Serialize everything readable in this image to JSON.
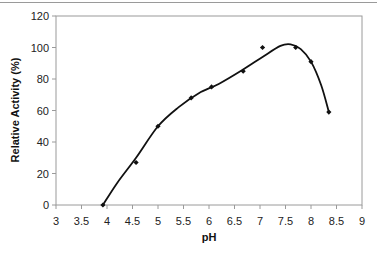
{
  "chart_data": {
    "type": "scatter",
    "title": "",
    "xlabel": "pH",
    "ylabel": "Relative Activity (%)",
    "xlim": [
      3,
      9
    ],
    "ylim": [
      0,
      120
    ],
    "x_ticks": [
      "3",
      "3.5",
      "4",
      "4.5",
      "5",
      "5.5",
      "6",
      "6.5",
      "7",
      "7.5",
      "8",
      "8.5",
      "9"
    ],
    "y_ticks": [
      "0",
      "20",
      "40",
      "60",
      "80",
      "100",
      "120"
    ],
    "grid": false,
    "legend": null,
    "series": [
      {
        "name": "Relative Activity",
        "marker": "diamond",
        "x": [
          3.92,
          4.57,
          5.0,
          5.65,
          6.05,
          6.67,
          7.05,
          7.7,
          8.0,
          8.35
        ],
        "y": [
          0,
          27,
          50,
          68,
          75,
          85,
          100,
          100,
          91,
          59
        ]
      }
    ],
    "fit_curve": {
      "type": "smooth",
      "x": [
        3.92,
        4.2,
        4.57,
        5.0,
        5.4,
        5.8,
        6.2,
        6.67,
        7.05,
        7.4,
        7.6,
        7.8,
        8.0,
        8.2,
        8.35
      ],
      "y": [
        0,
        14,
        30,
        50,
        62,
        71,
        77,
        86,
        94,
        101,
        102,
        99,
        91,
        76,
        59
      ]
    },
    "colors": {
      "line": "#111111",
      "marker": "#111111",
      "axis": "#9a9a9a",
      "plot_border": "#9a9a9a"
    }
  }
}
